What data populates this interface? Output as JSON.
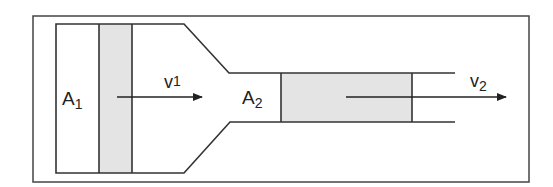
{
  "diagram": {
    "labels": {
      "area1": {
        "main": "A",
        "sub": "1"
      },
      "area2": {
        "main": "A",
        "sub": "2"
      },
      "velocity1": {
        "main": "v",
        "sub": "1"
      },
      "velocity2": {
        "main": "v",
        "sub": "2"
      }
    },
    "colors": {
      "stroke": "#333333",
      "fluid_slab": "#e4e4e4",
      "background": "#ffffff"
    }
  }
}
